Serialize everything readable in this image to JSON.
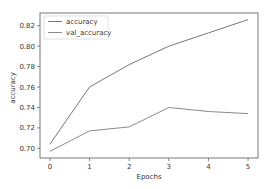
{
  "chart_data": {
    "type": "line",
    "title": "",
    "xlabel": "Epochs",
    "ylabel": "accuracy",
    "x": [
      0,
      1,
      2,
      3,
      4,
      5
    ],
    "series": [
      {
        "name": "accuracy",
        "values": [
          0.704,
          0.76,
          0.782,
          0.8,
          0.813,
          0.826
        ],
        "color": "#777777"
      },
      {
        "name": "val_accuracy",
        "values": [
          0.697,
          0.717,
          0.721,
          0.74,
          0.736,
          0.734
        ],
        "color": "#8a8a8a"
      }
    ],
    "xticks": [
      "0",
      "1",
      "2",
      "3",
      "4",
      "5"
    ],
    "yticks": [
      "0.70",
      "0.72",
      "0.74",
      "0.76",
      "0.78",
      "0.80",
      "0.82"
    ],
    "ytick_values": [
      0.7,
      0.72,
      0.74,
      0.76,
      0.78,
      0.8,
      0.82
    ],
    "xlim": [
      -0.25,
      5.25
    ],
    "ylim": [
      0.6905,
      0.8325
    ],
    "grid": false,
    "legend_position": "upper left"
  }
}
